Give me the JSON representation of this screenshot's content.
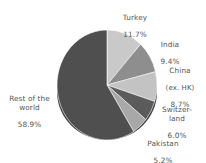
{
  "chart_data": {
    "type": "pie",
    "title": "",
    "subtitle": "",
    "xlabel": "",
    "ylabel": "",
    "legend_position": "none",
    "grid": false,
    "labels_outside": true,
    "start_angle_deg": 0,
    "direction": "clockwise",
    "categories": [
      "Turkey",
      "India",
      "China (ex. HK)",
      "Switzerland",
      "Pakistan",
      "Rest of the world"
    ],
    "values": [
      11.7,
      9.4,
      8.7,
      6.0,
      5.2,
      58.9
    ],
    "value_unit": "%",
    "colors": [
      "#c9c9c9",
      "#8e8e8e",
      "#c3c3c3",
      "#5b5b5b",
      "#a8a8a8",
      "#4f4f4f"
    ],
    "slices": [
      {
        "name": "Turkey",
        "value": 11.7,
        "value_label": "11.7%",
        "color": "#c9c9c9"
      },
      {
        "name": "India",
        "value": 9.4,
        "value_label": "9.4%",
        "color": "#8e8e8e"
      },
      {
        "name": "China",
        "value": 8.7,
        "value_label": "8.7%",
        "color": "#c3c3c3",
        "note": "(ex. HK)"
      },
      {
        "name": "Switzer-\nland",
        "value": 6.0,
        "value_label": "6.0%",
        "color": "#5b5b5b"
      },
      {
        "name": "Pakistan",
        "value": 5.2,
        "value_label": "5.2%",
        "color": "#a8a8a8"
      },
      {
        "name": "Rest of the\nworld",
        "value": 58.9,
        "value_label": "58.9%",
        "color": "#4f4f4f"
      }
    ]
  },
  "labels": {
    "turkey": {
      "name": "Turkey",
      "value": "11.7%"
    },
    "india": {
      "name": "India",
      "value": "9.4%"
    },
    "china": {
      "name": "China",
      "sub": "(ex. HK)",
      "value": "8.7%"
    },
    "switzerland": {
      "name": "Switzer-\nland",
      "value": "6.0%"
    },
    "pakistan": {
      "name": "Pakistan",
      "value": "5.2%"
    },
    "rest": {
      "name": "Rest of the\nworld",
      "value": "58.9%"
    }
  }
}
